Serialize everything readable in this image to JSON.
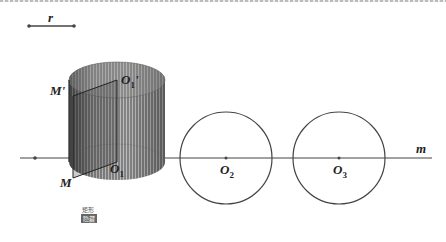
{
  "figure": {
    "segment_label": "r",
    "labels": {
      "M_prime": "M'",
      "O1_prime": "O",
      "O1_prime_sub": "1",
      "O1_prime_mark": "'",
      "M": "M",
      "O1": "O",
      "O1_sub": "1",
      "O2": "O",
      "O2_sub": "2",
      "O3": "O",
      "O3_sub": "3",
      "m": "m"
    },
    "cylinder": {
      "cx": 117,
      "top_cy": 80,
      "bottom_cy": 162,
      "rx": 48,
      "ry": 18
    },
    "circles": [
      {
        "name": "O2",
        "cx": 226,
        "cy": 158,
        "r": 46
      },
      {
        "name": "O3",
        "cx": 339,
        "cy": 158,
        "r": 46
      }
    ],
    "line_m": {
      "x1": 20,
      "y1": 158,
      "x2": 432,
      "y2": 158
    },
    "colors": {
      "stroke": "#444444",
      "cylinder_fill": "#777777",
      "background": "#ffffff"
    }
  },
  "controls": {
    "caption": "矩形",
    "button_label": "隐藏"
  }
}
